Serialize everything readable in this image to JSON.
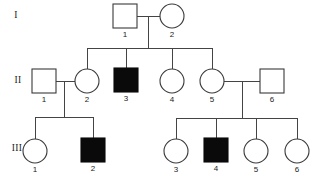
{
  "figure": {
    "kind": "pedigree-chart",
    "background_color": "#ffffff",
    "line_color": "#444444",
    "symbol_stroke_color": "#3a3a3a",
    "affected_fill_color": "#0a0a0a",
    "unaffected_fill_color": "#ffffff"
  },
  "generation_labels": [
    {
      "text": "I",
      "x": 16,
      "y": 16
    },
    {
      "text": "II",
      "x": 18,
      "y": 81
    },
    {
      "text": "III",
      "x": 17,
      "y": 149
    }
  ],
  "individuals": [
    {
      "id": "I-1",
      "label": "1",
      "sex": "male",
      "shape": "square",
      "affected": false,
      "cx": 125,
      "cy": 16,
      "size": 24
    },
    {
      "id": "I-2",
      "label": "2",
      "sex": "female",
      "shape": "circle",
      "affected": false,
      "cx": 172,
      "cy": 16,
      "size": 24
    },
    {
      "id": "II-1",
      "label": "1",
      "sex": "male",
      "shape": "square",
      "affected": false,
      "cx": 44,
      "cy": 81,
      "size": 24
    },
    {
      "id": "II-2",
      "label": "2",
      "sex": "female",
      "shape": "circle",
      "affected": false,
      "cx": 87,
      "cy": 81,
      "size": 24
    },
    {
      "id": "II-3",
      "label": "3",
      "sex": "male",
      "shape": "square",
      "affected": true,
      "cx": 126,
      "cy": 80,
      "size": 24
    },
    {
      "id": "II-4",
      "label": "4",
      "sex": "female",
      "shape": "circle",
      "affected": false,
      "cx": 172,
      "cy": 81,
      "size": 24
    },
    {
      "id": "II-5",
      "label": "5",
      "sex": "female",
      "shape": "circle",
      "affected": false,
      "cx": 212,
      "cy": 81,
      "size": 24
    },
    {
      "id": "II-6",
      "label": "6",
      "sex": "male",
      "shape": "square",
      "affected": false,
      "cx": 272,
      "cy": 81,
      "size": 24
    },
    {
      "id": "III-1",
      "label": "1",
      "sex": "female",
      "shape": "circle",
      "affected": false,
      "cx": 35,
      "cy": 151,
      "size": 24
    },
    {
      "id": "III-2",
      "label": "2",
      "sex": "male",
      "shape": "square",
      "affected": true,
      "cx": 93,
      "cy": 150,
      "size": 24
    },
    {
      "id": "III-3",
      "label": "3",
      "sex": "female",
      "shape": "circle",
      "affected": false,
      "cx": 176,
      "cy": 151,
      "size": 24
    },
    {
      "id": "III-4",
      "label": "4",
      "sex": "male",
      "shape": "square",
      "affected": true,
      "cx": 216,
      "cy": 150,
      "size": 24
    },
    {
      "id": "III-5",
      "label": "5",
      "sex": "female",
      "shape": "circle",
      "affected": false,
      "cx": 256,
      "cy": 151,
      "size": 24
    },
    {
      "id": "III-6",
      "label": "6",
      "sex": "female",
      "shape": "circle",
      "affected": false,
      "cx": 297,
      "cy": 151,
      "size": 24
    }
  ],
  "connectors": {
    "mating_lines": [
      {
        "name": "mating-I1-I2",
        "x1": 137,
        "y1": 16,
        "x2": 160,
        "y2": 16
      },
      {
        "name": "mating-II1-II2",
        "x1": 56,
        "y1": 81,
        "x2": 75,
        "y2": 81
      },
      {
        "name": "mating-II5-II6",
        "x1": 224,
        "y1": 81,
        "x2": 260,
        "y2": 81
      }
    ],
    "descent_lines": [
      {
        "name": "descent-I",
        "x1": 148,
        "y1": 16,
        "x2": 148,
        "y2": 48
      },
      {
        "name": "descent-II-left",
        "x1": 64,
        "y1": 81,
        "x2": 64,
        "y2": 117
      },
      {
        "name": "descent-II-right",
        "x1": 242,
        "y1": 81,
        "x2": 242,
        "y2": 118
      }
    ],
    "sibship_bars": [
      {
        "name": "sibship-bar-gen2",
        "x1": 87,
        "y": 48,
        "x2": 212
      },
      {
        "name": "sibship-bar-gen3-left",
        "x1": 35,
        "y": 117,
        "x2": 93
      },
      {
        "name": "sibship-bar-gen3-right",
        "x1": 176,
        "y": 118,
        "x2": 297
      }
    ],
    "child_stems": [
      {
        "name": "stem-II-1",
        "x": 87,
        "y1": 48,
        "y2": 69
      },
      {
        "name": "stem-II-3",
        "x": 126,
        "y1": 48,
        "y2": 68
      },
      {
        "name": "stem-II-4",
        "x": 172,
        "y1": 48,
        "y2": 69
      },
      {
        "name": "stem-II-5",
        "x": 212,
        "y1": 48,
        "y2": 69
      },
      {
        "name": "stem-III-1",
        "x": 35,
        "y1": 117,
        "y2": 139
      },
      {
        "name": "stem-III-2",
        "x": 93,
        "y1": 117,
        "y2": 138
      },
      {
        "name": "stem-III-3",
        "x": 176,
        "y1": 118,
        "y2": 139
      },
      {
        "name": "stem-III-4",
        "x": 216,
        "y1": 118,
        "y2": 138
      },
      {
        "name": "stem-III-5",
        "x": 256,
        "y1": 118,
        "y2": 139
      },
      {
        "name": "stem-III-6",
        "x": 297,
        "y1": 118,
        "y2": 139
      }
    ]
  }
}
